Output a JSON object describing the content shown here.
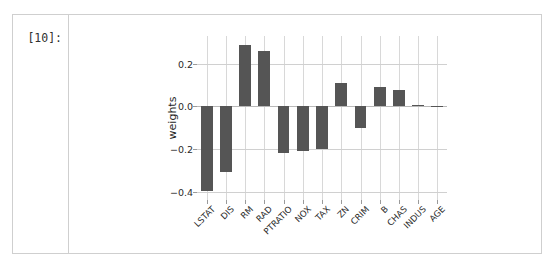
{
  "cell": {
    "prompt_label": "[10]:"
  },
  "chart_data": {
    "type": "bar",
    "title": "",
    "xlabel": "",
    "ylabel": "weights",
    "categories": [
      "LSTAT",
      "DIS",
      "RM",
      "RAD",
      "PTRATIO",
      "NOX",
      "TAX",
      "ZN",
      "CRIM",
      "B",
      "CHAS",
      "INDUS",
      "AGE"
    ],
    "values": [
      -0.4,
      -0.31,
      0.29,
      0.26,
      -0.22,
      -0.21,
      -0.2,
      0.11,
      -0.1,
      0.09,
      0.075,
      0.004,
      0.002
    ],
    "ylim": [
      -0.44,
      0.33
    ],
    "yticks": [
      0.2,
      0.0,
      -0.2,
      -0.4
    ],
    "ytick_labels": [
      "0.2",
      "0.0",
      "−0.2",
      "−0.4"
    ],
    "grid": true,
    "legend": "none",
    "bar_color": "#555555",
    "grid_color": "#d0d0d0",
    "background": "#ffffff"
  }
}
